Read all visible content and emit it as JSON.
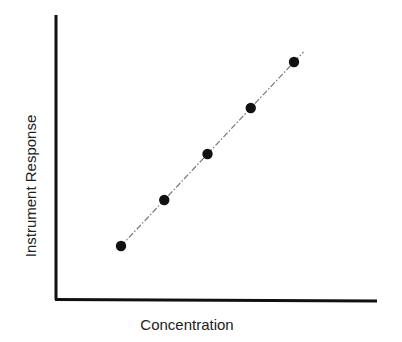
{
  "chart_data": {
    "type": "scatter",
    "title": "",
    "xlabel": "Concentration",
    "ylabel": "Instrument Response",
    "grid": false,
    "legend": null,
    "ticks": "none",
    "series": [
      {
        "name": "calibration points",
        "marker": "filled-circle",
        "x": [
          1,
          2,
          3,
          4,
          5
        ],
        "y": [
          1,
          2,
          3,
          4,
          5
        ]
      }
    ],
    "fit_line": {
      "style": "dash-dot",
      "extends_past_last_point": true
    },
    "xlim": [
      0,
      6
    ],
    "ylim": [
      0,
      5.9
    ]
  },
  "colors": {
    "axis": "#111111",
    "marker": "#111111",
    "line": "#777777",
    "text": "#222222"
  }
}
